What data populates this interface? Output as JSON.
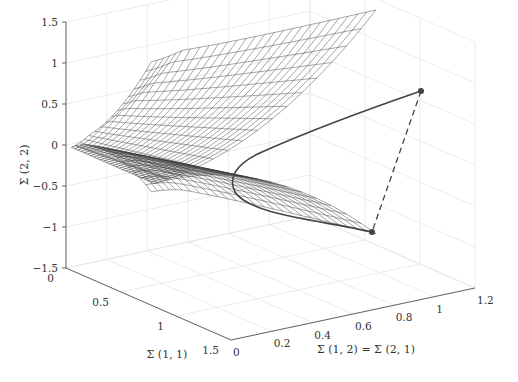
{
  "chart_data": {
    "type": "surface3d",
    "title": "",
    "xlabel": "Σ (1, 2) = Σ (2, 1)",
    "ylabel": "Σ (1, 1)",
    "zlabel": "Σ (2, 2)",
    "x_ticks": [
      "0",
      "0.2",
      "0.4",
      "0.6",
      "0.8",
      "1",
      "1.2"
    ],
    "y_ticks": [
      "0",
      "0.5",
      "1",
      "1.5"
    ],
    "z_ticks": [
      "−1.5",
      "−1",
      "−0.5",
      "0",
      "0.5",
      "1",
      "1.5"
    ],
    "xlim": [
      0,
      1.2
    ],
    "ylim": [
      0,
      1.5
    ],
    "zlim": [
      -1.5,
      1.5
    ],
    "grid": true,
    "surface": {
      "description": "Boundary of positive semidefinite 2x2 covariance cone: Σ(2,2) = ±Σ(1,2)^2/Σ(1,1)-like wireframe mesh",
      "style": "wireframe",
      "color": "#333333"
    },
    "series": [
      {
        "name": "geodesic-curve",
        "style": "solid",
        "color": "#444444",
        "points": [
          [
            1.0,
            0.35,
            1.0
          ],
          [
            0.55,
            0.35,
            0.2
          ],
          [
            0.3,
            0.5,
            0.0
          ],
          [
            0.55,
            0.55,
            -0.5
          ],
          [
            0.9,
            0.6,
            -1.0
          ]
        ]
      },
      {
        "name": "straight-line",
        "style": "dashed",
        "color": "#444444",
        "points": [
          [
            1.0,
            0.35,
            1.0
          ],
          [
            0.9,
            0.6,
            -1.0
          ]
        ]
      }
    ],
    "markers": [
      {
        "name": "endpoint-upper",
        "x": 1.0,
        "y": 0.35,
        "z": 1.0
      },
      {
        "name": "endpoint-lower",
        "x": 0.9,
        "y": 0.6,
        "z": -1.0
      }
    ]
  }
}
